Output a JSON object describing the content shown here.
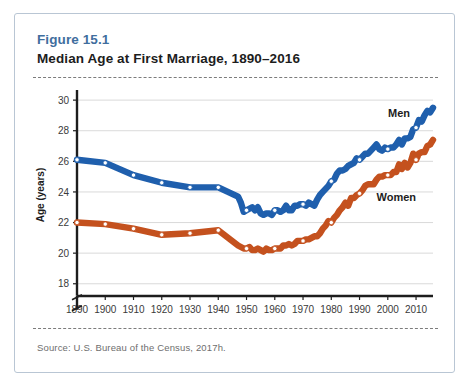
{
  "figure": {
    "number": "Figure 15.1",
    "title": "Median Age at First Marriage, 1890–2016",
    "number_color": "#3f6e9e",
    "source": "Source:  U.S. Bureau of the Census, 2017h."
  },
  "chart_data": {
    "type": "line",
    "title": "Median Age at First Marriage, 1890–2016",
    "xlabel": "",
    "ylabel": "Age (years)",
    "xlim": [
      1890,
      2016
    ],
    "ylim": [
      17.2,
      30.4
    ],
    "yticks": [
      18,
      20,
      22,
      24,
      26,
      28,
      30
    ],
    "xticks": [
      1890,
      1900,
      1910,
      1920,
      1930,
      1940,
      1950,
      1960,
      1970,
      1980,
      1990,
      2000,
      2010
    ],
    "grid": true,
    "y_axis_break": true,
    "legend_position": "inline",
    "marker_years": [
      1890,
      1900,
      1910,
      1920,
      1930,
      1940,
      1950,
      1960,
      1970,
      1980,
      1990,
      2000,
      2010
    ],
    "series": [
      {
        "name": "Men",
        "color": "#1f5fad",
        "label_x": 2004,
        "label_y": 28.9,
        "x": [
          1890,
          1900,
          1910,
          1920,
          1930,
          1940,
          1947,
          1948,
          1949,
          1950,
          1951,
          1952,
          1953,
          1954,
          1955,
          1956,
          1957,
          1958,
          1959,
          1960,
          1961,
          1962,
          1963,
          1964,
          1965,
          1966,
          1967,
          1968,
          1969,
          1970,
          1971,
          1972,
          1973,
          1974,
          1975,
          1976,
          1977,
          1978,
          1979,
          1980,
          1981,
          1982,
          1983,
          1984,
          1985,
          1986,
          1987,
          1988,
          1989,
          1990,
          1991,
          1992,
          1993,
          1994,
          1995,
          1996,
          1997,
          1998,
          1999,
          2000,
          2001,
          2002,
          2003,
          2004,
          2005,
          2006,
          2007,
          2008,
          2009,
          2010,
          2011,
          2012,
          2013,
          2014,
          2015,
          2016
        ],
        "y": [
          26.1,
          25.9,
          25.1,
          24.6,
          24.3,
          24.3,
          23.7,
          23.3,
          22.7,
          22.8,
          22.9,
          23.0,
          22.8,
          23.0,
          22.6,
          22.5,
          22.6,
          22.6,
          22.5,
          22.8,
          22.8,
          22.7,
          22.8,
          23.1,
          22.8,
          22.8,
          23.1,
          23.1,
          23.2,
          23.2,
          23.1,
          23.3,
          23.2,
          23.1,
          23.5,
          23.8,
          24.0,
          24.2,
          24.4,
          24.7,
          24.8,
          25.2,
          25.4,
          25.4,
          25.5,
          25.7,
          25.8,
          25.9,
          26.2,
          26.1,
          26.3,
          26.5,
          26.5,
          26.7,
          26.9,
          27.1,
          26.8,
          26.7,
          26.9,
          26.8,
          26.9,
          26.9,
          27.1,
          27.4,
          27.1,
          27.5,
          27.5,
          27.6,
          28.1,
          28.2,
          28.7,
          28.6,
          29.0,
          29.3,
          29.2,
          29.5
        ]
      },
      {
        "name": "Women",
        "color": "#c4511e",
        "label_x": 2003,
        "label_y": 23.4,
        "x": [
          1890,
          1900,
          1910,
          1920,
          1930,
          1940,
          1947,
          1948,
          1949,
          1950,
          1951,
          1952,
          1953,
          1954,
          1955,
          1956,
          1957,
          1958,
          1959,
          1960,
          1961,
          1962,
          1963,
          1964,
          1965,
          1966,
          1967,
          1968,
          1969,
          1970,
          1971,
          1972,
          1973,
          1974,
          1975,
          1976,
          1977,
          1978,
          1979,
          1980,
          1981,
          1982,
          1983,
          1984,
          1985,
          1986,
          1987,
          1988,
          1989,
          1990,
          1991,
          1992,
          1993,
          1994,
          1995,
          1996,
          1997,
          1998,
          1999,
          2000,
          2001,
          2002,
          2003,
          2004,
          2005,
          2006,
          2007,
          2008,
          2009,
          2010,
          2011,
          2012,
          2013,
          2014,
          2015,
          2016
        ],
        "y": [
          22.0,
          21.9,
          21.6,
          21.2,
          21.3,
          21.5,
          20.5,
          20.4,
          20.3,
          20.3,
          20.4,
          20.2,
          20.2,
          20.3,
          20.2,
          20.1,
          20.3,
          20.2,
          20.2,
          20.3,
          20.3,
          20.3,
          20.5,
          20.5,
          20.6,
          20.5,
          20.6,
          20.8,
          20.8,
          20.8,
          20.9,
          20.9,
          21.0,
          21.1,
          21.1,
          21.3,
          21.6,
          21.8,
          22.1,
          22.0,
          22.3,
          22.5,
          22.8,
          23.0,
          23.3,
          23.1,
          23.6,
          23.6,
          23.8,
          23.9,
          24.1,
          24.4,
          24.5,
          24.5,
          24.5,
          24.8,
          25.0,
          25.0,
          25.1,
          25.1,
          25.1,
          25.3,
          25.3,
          25.8,
          25.5,
          25.9,
          25.6,
          25.9,
          26.5,
          26.1,
          26.5,
          26.6,
          26.6,
          27.0,
          27.1,
          27.4
        ]
      }
    ]
  }
}
